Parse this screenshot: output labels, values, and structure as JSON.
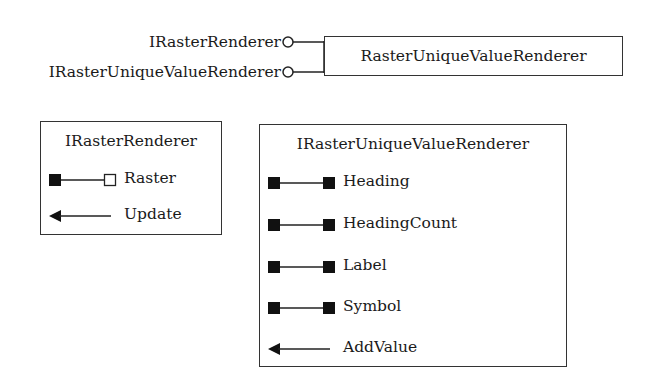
{
  "coclass": {
    "name": "RasterUniqueValueRenderer",
    "implements": [
      "IRasterRenderer",
      "IRasterUniqueValueRenderer"
    ]
  },
  "interfaces": [
    {
      "name": "IRasterRenderer",
      "members": [
        {
          "name": "Raster",
          "kind": "property-put-by-reference"
        },
        {
          "name": "Update",
          "kind": "method"
        }
      ]
    },
    {
      "name": "IRasterUniqueValueRenderer",
      "members": [
        {
          "name": "Heading",
          "kind": "property-read-write"
        },
        {
          "name": "HeadingCount",
          "kind": "property-read-write"
        },
        {
          "name": "Label",
          "kind": "property-read-write"
        },
        {
          "name": "Symbol",
          "kind": "property-read-write"
        },
        {
          "name": "AddValue",
          "kind": "method"
        }
      ]
    }
  ]
}
